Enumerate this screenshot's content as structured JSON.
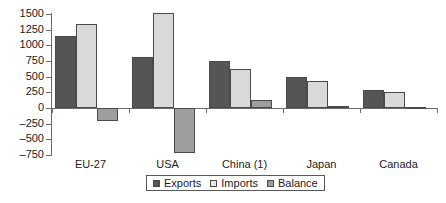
{
  "chart_data": {
    "type": "bar",
    "title": "",
    "subtitle": "",
    "xlabel": "",
    "ylabel": "",
    "categories": [
      "EU-27",
      "USA",
      "China (1)",
      "Japan",
      "Canada"
    ],
    "series": [
      {
        "name": "Exports",
        "color": "#555555",
        "values": [
          1150,
          820,
          755,
          490,
          290
        ]
      },
      {
        "name": "Imports",
        "color": "#d9d9d9",
        "values": [
          1340,
          1520,
          615,
          435,
          250
        ]
      },
      {
        "name": "Balance",
        "color": "#9e9e9e",
        "values": [
          -200,
          -720,
          120,
          30,
          15
        ]
      }
    ],
    "ylim": [
      -750,
      1500
    ],
    "yticks": [
      1500,
      1250,
      1000,
      750,
      500,
      250,
      0,
      -250,
      -500,
      -750
    ],
    "ytick_labels": [
      "1500",
      "1250",
      "1000",
      "750",
      "500",
      "250",
      "0",
      "–250",
      "–500",
      "–750"
    ],
    "grid": false,
    "legend_position": "bottom-center",
    "legend_entries": [
      "Exports",
      "Imports",
      "Balance"
    ]
  },
  "axis": {
    "y_labels": [
      "1500",
      "1250",
      "1000",
      "750",
      "500",
      "250",
      "0",
      "–250",
      "–500",
      "–750"
    ],
    "x_labels": [
      "EU-27",
      "USA",
      "China (1)",
      "Japan",
      "Canada"
    ]
  },
  "legend": {
    "items": [
      {
        "label": "Exports"
      },
      {
        "label": "Imports"
      },
      {
        "label": "Balance"
      }
    ]
  }
}
